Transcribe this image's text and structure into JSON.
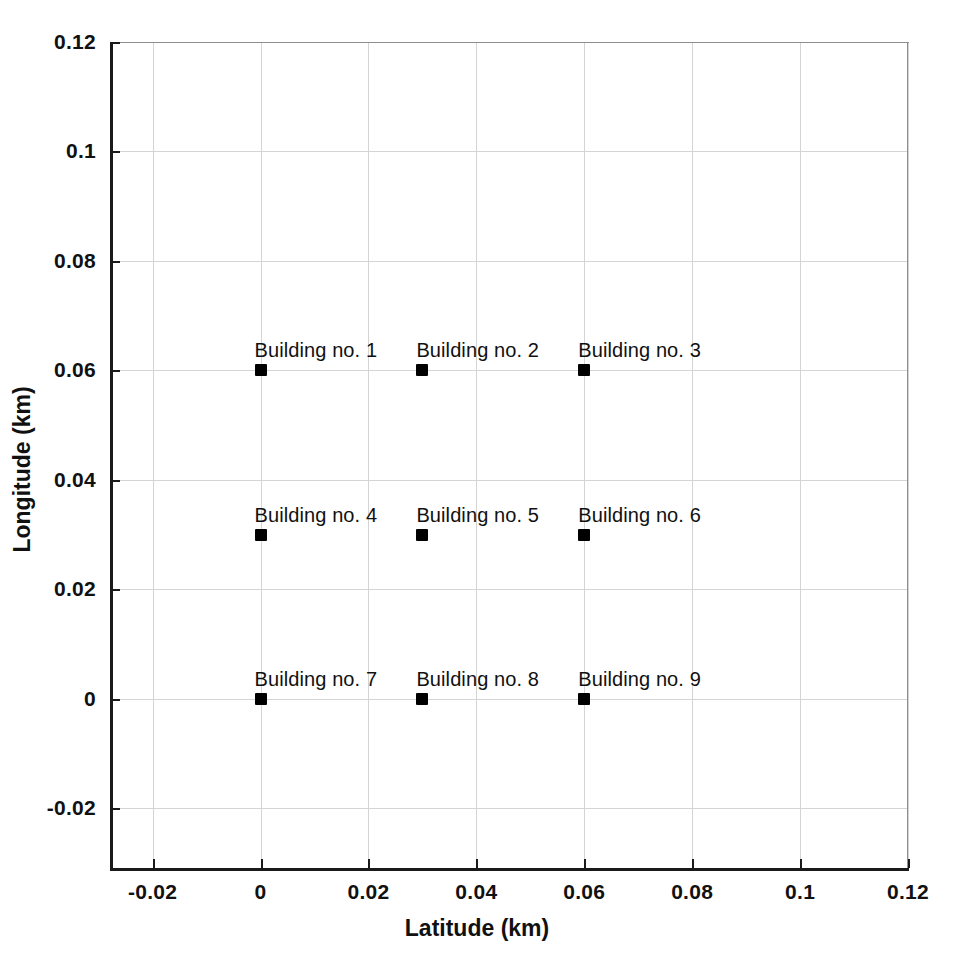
{
  "chart_data": {
    "type": "scatter",
    "title": "",
    "xlabel": "Latitude (km)",
    "ylabel": "Longitude (km)",
    "xlim": [
      -0.0279,
      0.12
    ],
    "ylim": [
      -0.0313,
      0.12
    ],
    "xticks": [
      -0.02,
      0,
      0.02,
      0.04,
      0.06,
      0.08,
      0.1,
      0.12
    ],
    "yticks": [
      -0.02,
      0,
      0.02,
      0.04,
      0.06,
      0.08,
      0.1,
      0.12
    ],
    "xticklabels": [
      "-0.02",
      "0",
      "0.02",
      "0.04",
      "0.06",
      "0.08",
      "0.1",
      "0.12"
    ],
    "yticklabels": [
      "-0.02",
      "0",
      "0.02",
      "0.04",
      "0.06",
      "0.08",
      "0.1",
      "0.12"
    ],
    "grid": true,
    "legend": "none",
    "marker_color": "#000000",
    "marker_shape": "square",
    "gridline_color": "#d4d4d4",
    "axis_color": "#1a1a1a",
    "background_color": "#ffffff",
    "points": [
      {
        "label": "Building no. 1",
        "x": 0.0,
        "y": 0.06
      },
      {
        "label": "Building no. 2",
        "x": 0.03,
        "y": 0.06
      },
      {
        "label": "Building no. 3",
        "x": 0.06,
        "y": 0.06
      },
      {
        "label": "Building no. 4",
        "x": 0.0,
        "y": 0.03
      },
      {
        "label": "Building no. 5",
        "x": 0.03,
        "y": 0.03
      },
      {
        "label": "Building no. 6",
        "x": 0.06,
        "y": 0.03
      },
      {
        "label": "Building no. 7",
        "x": 0.0,
        "y": 0.0
      },
      {
        "label": "Building no. 8",
        "x": 0.03,
        "y": 0.0
      },
      {
        "label": "Building no. 9",
        "x": 0.06,
        "y": 0.0
      }
    ]
  }
}
